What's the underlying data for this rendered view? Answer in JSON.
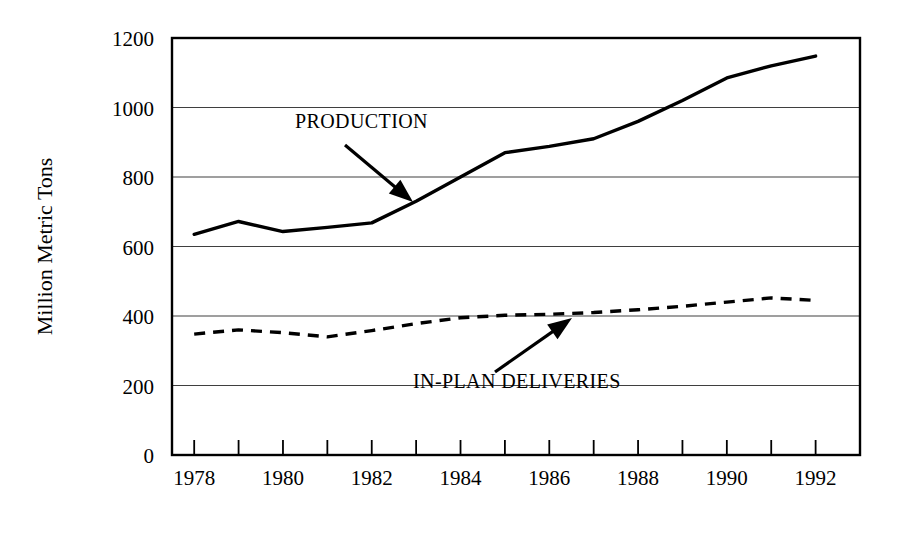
{
  "chart_data": {
    "type": "line",
    "title": "",
    "xlabel": "",
    "ylabel": "Million Metric Tons",
    "xlim": [
      1977.5,
      1993.0
    ],
    "ylim": [
      0,
      1200
    ],
    "grid": true,
    "legend_position": "inline-annotations",
    "x_tick_labels": [
      "1978",
      "1980",
      "1982",
      "1984",
      "1986",
      "1988",
      "1990",
      "1992"
    ],
    "x_tick_values": [
      1978,
      1980,
      1982,
      1984,
      1986,
      1988,
      1990,
      1992
    ],
    "x_minor_tick_values": [
      1978,
      1979,
      1980,
      1981,
      1982,
      1983,
      1984,
      1985,
      1986,
      1987,
      1988,
      1989,
      1990,
      1991,
      1992
    ],
    "y_tick_labels": [
      "0",
      "200",
      "400",
      "600",
      "800",
      "1000",
      "1200"
    ],
    "y_tick_values": [
      0,
      200,
      400,
      600,
      800,
      1000,
      1200
    ],
    "series": [
      {
        "name": "PRODUCTION",
        "style": "solid",
        "x": [
          1978,
          1979,
          1980,
          1981,
          1982,
          1983,
          1984,
          1985,
          1986,
          1987,
          1988,
          1989,
          1990,
          1991,
          1992
        ],
        "values": [
          635,
          672,
          643,
          655,
          668,
          730,
          800,
          870,
          888,
          910,
          960,
          1020,
          1085,
          1120,
          1148
        ]
      },
      {
        "name": "IN-PLAN DELIVERIES",
        "style": "dashed",
        "x": [
          1978,
          1979,
          1980,
          1981,
          1982,
          1983,
          1984,
          1985,
          1986,
          1987,
          1988,
          1989,
          1990,
          1991,
          1992
        ],
        "values": [
          348,
          360,
          352,
          340,
          358,
          378,
          395,
          402,
          405,
          410,
          418,
          428,
          440,
          452,
          445
        ]
      }
    ],
    "annotations": [
      {
        "label": "PRODUCTION",
        "text_x": 295,
        "text_y": 128,
        "arrow_from_x": 345,
        "arrow_from_y": 145,
        "arrow_to_x": 413,
        "arrow_to_y": 202
      },
      {
        "label": "IN-PLAN DELIVERIES",
        "text_x": 413,
        "text_y": 388,
        "arrow_from_x": 495,
        "arrow_from_y": 372,
        "arrow_to_x": 572,
        "arrow_to_y": 318
      }
    ]
  }
}
